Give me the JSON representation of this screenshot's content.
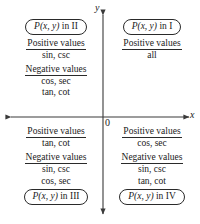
{
  "diagram": {
    "axes": {
      "x_label": "x",
      "y_label": "y",
      "origin_label": "0",
      "x_arrow_both_ends": true,
      "y_arrow_both_ends": true,
      "axis_color": "#3a3a3a"
    },
    "quadrants": [
      {
        "id": "quadrant-2",
        "point_label_prefix": "P",
        "point_label_args": "(x, y)",
        "point_label_suffix": "in II",
        "capsule_position": "top",
        "groups": [
          {
            "header": "Positive values",
            "values": [
              "sin, csc"
            ]
          },
          {
            "header": "Negative values",
            "values": [
              "cos, sec",
              "tan, cot"
            ]
          }
        ]
      },
      {
        "id": "quadrant-1",
        "point_label_prefix": "P",
        "point_label_args": "(x, y)",
        "point_label_suffix": "in I",
        "capsule_position": "top",
        "groups": [
          {
            "header": "Positive values",
            "values": [
              "all"
            ]
          }
        ]
      },
      {
        "id": "quadrant-3",
        "point_label_prefix": "P",
        "point_label_args": "(x, y)",
        "point_label_suffix": "in III",
        "capsule_position": "bottom",
        "groups": [
          {
            "header": "Positive values",
            "values": [
              "tan, cot"
            ]
          },
          {
            "header": "Negative values",
            "values": [
              "sin, csc",
              "cos, sec"
            ]
          }
        ]
      },
      {
        "id": "quadrant-4",
        "point_label_prefix": "P",
        "point_label_args": "(x, y)",
        "point_label_suffix": "in IV",
        "capsule_position": "bottom",
        "groups": [
          {
            "header": "Positive values",
            "values": [
              "cos, sec"
            ]
          },
          {
            "header": "Negative values",
            "values": [
              "sin, csc",
              "tan, cot"
            ]
          }
        ]
      }
    ]
  }
}
